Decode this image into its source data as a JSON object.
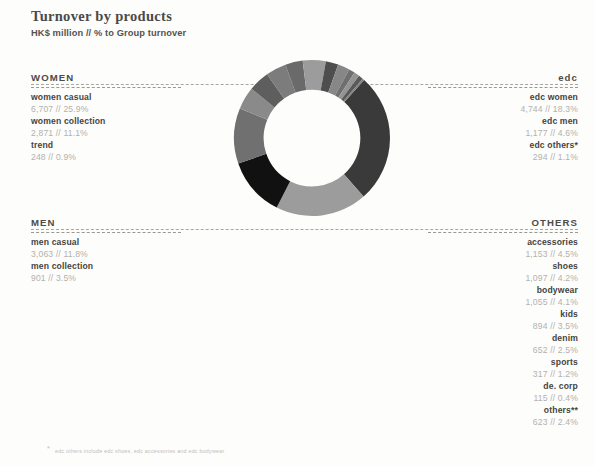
{
  "header": {
    "title": "Turnover by products",
    "subtitle": "HK$ million // % to Group turnover"
  },
  "sections": {
    "women": {
      "heading": "WOMEN",
      "items": [
        {
          "label": "women casual",
          "value": "6,707 // 25.9%"
        },
        {
          "label": "women collection",
          "value": "2,871 // 11.1%"
        },
        {
          "label": "trend",
          "value": "248 // 0.9%"
        }
      ]
    },
    "men": {
      "heading": "MEN",
      "items": [
        {
          "label": "men casual",
          "value": "3,063 // 11.8%"
        },
        {
          "label": "men collection",
          "value": "901 // 3.5%"
        }
      ]
    },
    "edc": {
      "heading": "edc",
      "items": [
        {
          "label": "edc women",
          "value": "4,744 // 18.3%"
        },
        {
          "label": "edc men",
          "value": "1,177 // 4.6%"
        },
        {
          "label": "edc others*",
          "value": "294 // 1.1%"
        }
      ]
    },
    "others": {
      "heading": "OTHERS",
      "items": [
        {
          "label": "accessories",
          "value": "1,153 // 4.5%"
        },
        {
          "label": "shoes",
          "value": "1,097 // 4.2%"
        },
        {
          "label": "bodywear",
          "value": "1,055 // 4.1%"
        },
        {
          "label": "kids",
          "value": "894 // 3.5%"
        },
        {
          "label": "denim",
          "value": "652 // 2.5%"
        },
        {
          "label": "sports",
          "value": "317 // 1.2%"
        },
        {
          "label": "de. corp",
          "value": "115 // 0.4%"
        },
        {
          "label": "others**",
          "value": "623 // 2.4%"
        }
      ]
    }
  },
  "footnote": {
    "marker": "*",
    "text": "edc others include edc shoes, edc accessories and edc bodywear"
  },
  "chart_data": {
    "type": "pie",
    "variant": "donut",
    "title": "Turnover by products",
    "subtitle": "HK$ million // % to Group turnover",
    "unit": "HK$ million",
    "value_label": "% to Group turnover",
    "start_angle_deg": -48,
    "direction": "clockwise",
    "inner_radius_ratio": 0.62,
    "categories": [
      "women casual",
      "edc women",
      "men casual",
      "women collection",
      "accessories",
      "shoes",
      "bodywear",
      "kids",
      "edc men",
      "denim",
      "others**",
      "sports",
      "edc others*",
      "trend",
      "de. corp"
    ],
    "values": [
      25.9,
      18.3,
      11.8,
      11.1,
      4.5,
      4.2,
      4.1,
      3.5,
      4.6,
      2.5,
      2.4,
      1.2,
      1.1,
      0.9,
      0.4
    ],
    "amounts": [
      6707,
      4744,
      3063,
      2871,
      1153,
      1097,
      1055,
      894,
      1177,
      652,
      623,
      317,
      294,
      248,
      115
    ],
    "colors": [
      "#3a3a3a",
      "#9c9c9c",
      "#111111",
      "#707070",
      "#8a8a8a",
      "#5e5e5e",
      "#7c7c7c",
      "#6a6a6a",
      "#9c9c9c",
      "#4e4e4e",
      "#878787",
      "#6f6f6f",
      "#949494",
      "#5a5a5a",
      "#808080"
    ],
    "legend_position": "sides",
    "grid": false
  }
}
